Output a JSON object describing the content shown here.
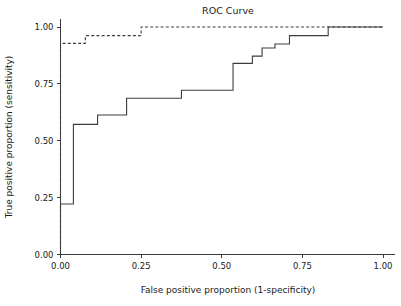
{
  "chart_data": {
    "type": "line",
    "title": "ROC Curve",
    "xlabel": "False positive proportion (1-specificity)",
    "ylabel": "True positive proportion (sensitivity)",
    "xlim": [
      0.0,
      1.0
    ],
    "ylim": [
      0.0,
      1.0
    ],
    "grid": false,
    "legend": null,
    "xticks": [
      0.0,
      0.25,
      0.5,
      0.75,
      1.0
    ],
    "xtick_labels": [
      "0.00",
      "0.25",
      "0.50",
      "0.75",
      "1.00"
    ],
    "yticks": [
      0.0,
      0.25,
      0.5,
      0.75,
      1.0
    ],
    "ytick_labels": [
      "0.00",
      "0.25",
      "0.50",
      "0.75",
      "1.00"
    ],
    "series": [
      {
        "name": "roc-curve-solid",
        "style": "solid",
        "color": "#3d3d3d",
        "drawstyle": "steps-post",
        "x": [
          0.0,
          0.0,
          0.018,
          0.04,
          0.04,
          0.115,
          0.115,
          0.205,
          0.205,
          0.375,
          0.375,
          0.535,
          0.535,
          0.595,
          0.595,
          0.625,
          0.625,
          0.665,
          0.665,
          0.71,
          0.71,
          0.83,
          0.83,
          1.0
        ],
        "y": [
          0.0,
          0.222,
          0.222,
          0.222,
          0.572,
          0.572,
          0.613,
          0.613,
          0.687,
          0.687,
          0.722,
          0.722,
          0.84,
          0.84,
          0.872,
          0.872,
          0.908,
          0.908,
          0.925,
          0.925,
          0.962,
          0.962,
          1.0,
          1.0
        ]
      },
      {
        "name": "roc-curve-dashed",
        "style": "dashed",
        "color": "#3d3d3d",
        "drawstyle": "steps-post",
        "x": [
          0.0,
          0.0,
          0.077,
          0.077,
          0.25,
          0.25,
          1.0
        ],
        "y": [
          0.0,
          0.928,
          0.928,
          0.962,
          0.962,
          1.0,
          1.0
        ]
      }
    ]
  }
}
